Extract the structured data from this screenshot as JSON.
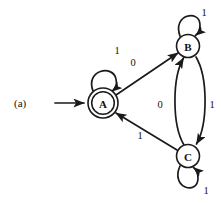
{
  "figure": {
    "panel_label": "(a)",
    "width": 221,
    "height": 205,
    "background_color": "#ffffff",
    "ink_color": "#1a1a1a",
    "type": "state-transition-diagram"
  },
  "diagram_data": {
    "type": "finite-state-automaton",
    "start_state": "A",
    "accepting_states": [
      "A"
    ],
    "alphabet": [
      "0",
      "1"
    ],
    "nodes": [
      {
        "id": "A",
        "label": "A",
        "cx": 103,
        "cy": 103,
        "r": 15,
        "accepting": true
      },
      {
        "id": "B",
        "label": "B",
        "cx": 188,
        "cy": 46,
        "r": 11.5,
        "accepting": false
      },
      {
        "id": "C",
        "label": "C",
        "cx": 188,
        "cy": 156,
        "r": 11.5,
        "accepting": false
      }
    ],
    "edges": [
      {
        "from": "A",
        "to": "A",
        "label": "1",
        "kind": "self-loop",
        "label_x": 117,
        "label_y": 50
      },
      {
        "from": "A",
        "to": "B",
        "label": "0",
        "kind": "straight",
        "label_x": 133,
        "label_y": 62
      },
      {
        "from": "B",
        "to": "B",
        "label": "1",
        "kind": "self-loop",
        "label_x": 204,
        "label_y": 12
      },
      {
        "from": "B",
        "to": "C",
        "label": "1",
        "kind": "curve-right",
        "label_x": 212,
        "label_y": 104
      },
      {
        "from": "C",
        "to": "B",
        "label": "0",
        "kind": "curve-left",
        "label_x": 160,
        "label_y": 104
      },
      {
        "from": "C",
        "to": "C",
        "label": "1",
        "kind": "self-loop",
        "label_x": 206,
        "label_y": 190
      },
      {
        "from": "C",
        "to": "A",
        "label": "1",
        "kind": "straight",
        "label_x": 140,
        "label_y": 135
      }
    ],
    "start_arrow": {
      "x1": 55,
      "y1": 103,
      "x2": 86,
      "y2": 103
    }
  }
}
